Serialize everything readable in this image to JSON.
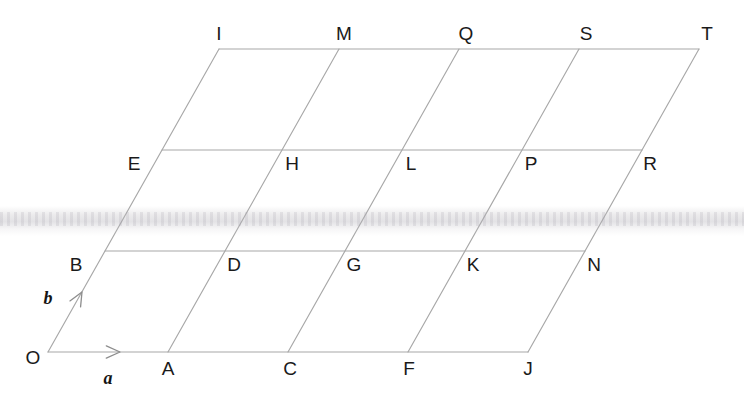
{
  "figure": {
    "kind": "lattice-diagram",
    "line_color": "#a8a8a8",
    "label_color": "#1a1a1a",
    "background_color": "#ffffff",
    "width": 744,
    "height": 409
  },
  "geometry": {
    "origin": {
      "x": 48,
      "y": 352
    },
    "vector_a": {
      "dx": 120,
      "dy": 0
    },
    "vector_b": {
      "dx": 57,
      "dy": -101
    },
    "columns": 4,
    "rows": 3
  },
  "vectors": [
    {
      "id": "a",
      "label": "a",
      "label_x": 108,
      "label_y": 378,
      "tail_x": 48,
      "tail_y": 352,
      "tip_x": 120,
      "tip_y": 352
    },
    {
      "id": "b",
      "label": "b",
      "label_x": 48,
      "label_y": 298,
      "tail_x": 48,
      "tail_y": 352,
      "tip_x": 82,
      "tip_y": 292
    }
  ],
  "points": [
    {
      "id": "O",
      "label": "O",
      "x": 48,
      "y": 352,
      "label_x": 33,
      "label_y": 357,
      "i": 0,
      "j": 0
    },
    {
      "id": "A",
      "label": "A",
      "x": 168,
      "y": 352,
      "label_x": 168,
      "label_y": 368,
      "i": 1,
      "j": 0
    },
    {
      "id": "C",
      "label": "C",
      "x": 288,
      "y": 352,
      "label_x": 290,
      "label_y": 368,
      "i": 2,
      "j": 0
    },
    {
      "id": "F",
      "label": "F",
      "x": 408,
      "y": 352,
      "label_x": 409,
      "label_y": 368,
      "i": 3,
      "j": 0
    },
    {
      "id": "J",
      "label": "J",
      "x": 528,
      "y": 352,
      "label_x": 528,
      "label_y": 368,
      "i": 4,
      "j": 0
    },
    {
      "id": "B",
      "label": "B",
      "x": 105,
      "y": 251,
      "label_x": 76,
      "label_y": 264,
      "i": 0,
      "j": 1
    },
    {
      "id": "D",
      "label": "D",
      "x": 225,
      "y": 251,
      "label_x": 234,
      "label_y": 264,
      "i": 1,
      "j": 1
    },
    {
      "id": "G",
      "label": "G",
      "x": 345,
      "y": 251,
      "label_x": 354,
      "label_y": 264,
      "i": 2,
      "j": 1
    },
    {
      "id": "K",
      "label": "K",
      "x": 465,
      "y": 251,
      "label_x": 473,
      "label_y": 264,
      "i": 3,
      "j": 1
    },
    {
      "id": "N",
      "label": "N",
      "x": 585,
      "y": 251,
      "label_x": 594,
      "label_y": 264,
      "i": 4,
      "j": 1
    },
    {
      "id": "E",
      "label": "E",
      "x": 162,
      "y": 150,
      "label_x": 134,
      "label_y": 163,
      "i": 0,
      "j": 2
    },
    {
      "id": "H",
      "label": "H",
      "x": 282,
      "y": 150,
      "label_x": 292,
      "label_y": 163,
      "i": 1,
      "j": 2
    },
    {
      "id": "L",
      "label": "L",
      "x": 402,
      "y": 150,
      "label_x": 411,
      "label_y": 163,
      "i": 2,
      "j": 2
    },
    {
      "id": "P",
      "label": "P",
      "x": 522,
      "y": 150,
      "label_x": 531,
      "label_y": 163,
      "i": 3,
      "j": 2
    },
    {
      "id": "R",
      "label": "R",
      "x": 642,
      "y": 150,
      "label_x": 650,
      "label_y": 163,
      "i": 4,
      "j": 2
    },
    {
      "id": "I",
      "label": "I",
      "x": 219,
      "y": 49,
      "label_x": 219,
      "label_y": 33,
      "i": 0,
      "j": 3
    },
    {
      "id": "M",
      "label": "M",
      "x": 339,
      "y": 49,
      "label_x": 344,
      "label_y": 33,
      "i": 1,
      "j": 3
    },
    {
      "id": "Q",
      "label": "Q",
      "x": 459,
      "y": 49,
      "label_x": 466,
      "label_y": 33,
      "i": 2,
      "j": 3
    },
    {
      "id": "S",
      "label": "S",
      "x": 579,
      "y": 49,
      "label_x": 586,
      "label_y": 33,
      "i": 3,
      "j": 3
    },
    {
      "id": "T",
      "label": "T",
      "x": 699,
      "y": 49,
      "label_x": 707,
      "label_y": 33,
      "i": 4,
      "j": 3
    }
  ]
}
